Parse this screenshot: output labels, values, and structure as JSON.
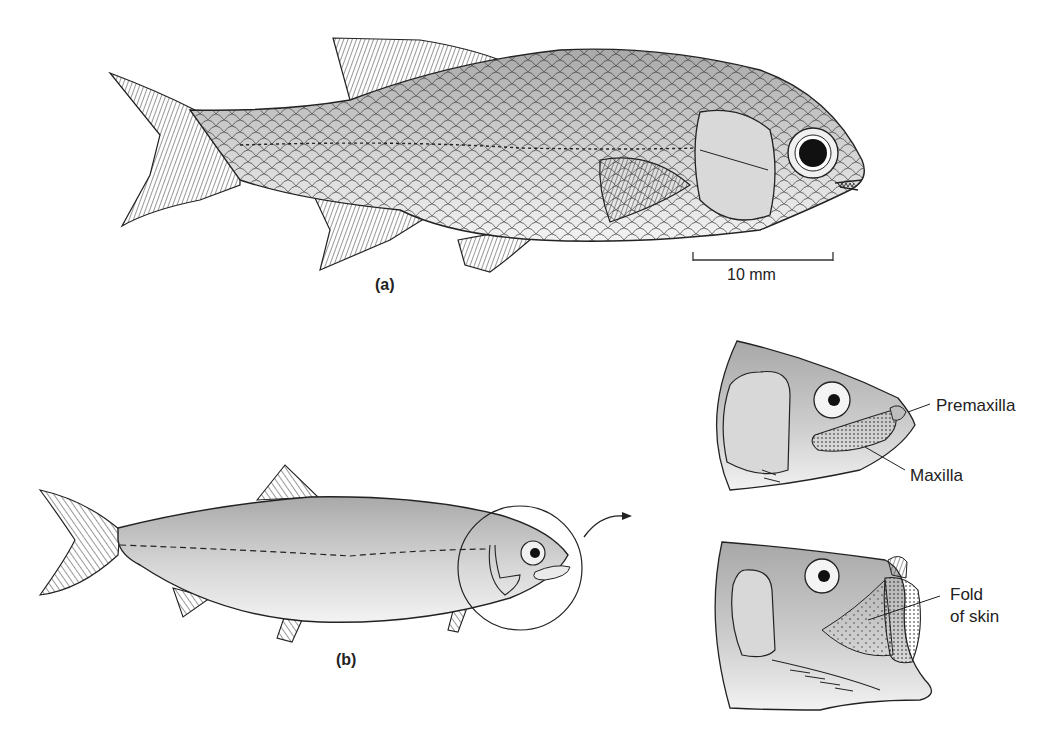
{
  "figure": {
    "panel_a": {
      "label": "(a)",
      "scale_bar_label": "10 mm"
    },
    "panel_b": {
      "label": "(b)",
      "head_closeups": [
        {
          "annotations": [
            "Premaxilla",
            "Maxilla"
          ]
        },
        {
          "annotations": [
            "Fold",
            "of skin"
          ]
        }
      ]
    }
  }
}
